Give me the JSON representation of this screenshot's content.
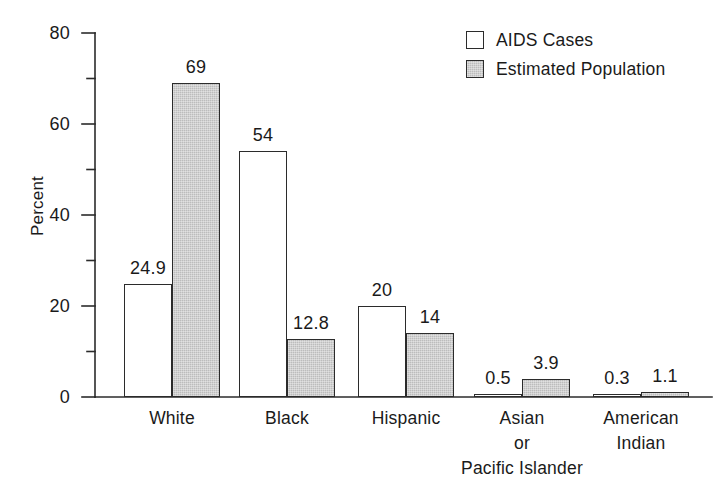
{
  "chart_data": {
    "type": "bar",
    "title": "",
    "subtitle": "",
    "xlabel": "",
    "ylabel": "Percent",
    "ylim": [
      0,
      80
    ],
    "yticks": [
      0,
      20,
      40,
      60,
      80
    ],
    "yticks_minor": [
      10,
      30,
      50,
      70
    ],
    "grid": false,
    "legend_position": "top-right",
    "categories": [
      "White",
      "Black",
      "Hispanic",
      "Asian\nor\nPacific Islander",
      "American\nIndian"
    ],
    "category_labels_flat": [
      "White",
      "Black",
      "Hispanic",
      "Asian or Pacific Islander",
      "American Indian"
    ],
    "series": [
      {
        "name": "AIDS Cases",
        "fill": "#ffffff",
        "values": [
          24.9,
          54,
          20,
          0.5,
          0.3
        ],
        "value_labels": [
          "24.9",
          "54",
          "20",
          "0.5",
          "0.3"
        ]
      },
      {
        "name": "Estimated Population",
        "fill": "#bcbcbc",
        "values": [
          69,
          12.8,
          14,
          3.9,
          1.1
        ],
        "value_labels": [
          "69",
          "12.8",
          "14",
          "3.9",
          "1.1"
        ]
      }
    ]
  },
  "axis": {
    "y_title": "Percent",
    "tick_labels": [
      "80",
      "60",
      "40",
      "20",
      "0"
    ]
  },
  "legend": {
    "items": [
      {
        "label": "AIDS Cases"
      },
      {
        "label": "Estimated Population"
      }
    ]
  },
  "colors": {
    "background": "#ffffff",
    "ink": "#1a1a1a",
    "axis": "#2b2b2b",
    "series_aids_cases": "#ffffff",
    "series_estimated_population": "#bcbcbc"
  }
}
